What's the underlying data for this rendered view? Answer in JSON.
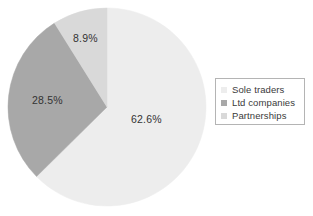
{
  "chart_data": {
    "type": "pie",
    "title": "",
    "labels": [
      "Sole traders",
      "Ltd companies",
      "Partnerships"
    ],
    "values": [
      62.6,
      28.5,
      8.9
    ],
    "value_labels": [
      "62.6%",
      "28.5%",
      "8.9%"
    ],
    "colors": [
      "#ededed",
      "#a8a8a8",
      "#d9d9d9"
    ],
    "start_angle_deg": 0,
    "direction": "clockwise",
    "legend_position": "right",
    "grid": false
  },
  "legend": {
    "entries": [
      {
        "label": "Sole traders",
        "color": "#ededed"
      },
      {
        "label": "Ltd companies",
        "color": "#a8a8a8"
      },
      {
        "label": "Partnerships",
        "color": "#d9d9d9"
      }
    ]
  },
  "pie": {
    "slice_labels": {
      "sole_traders": "62.6%",
      "ltd_companies": "28.5%",
      "partnerships": "8.9%"
    }
  }
}
